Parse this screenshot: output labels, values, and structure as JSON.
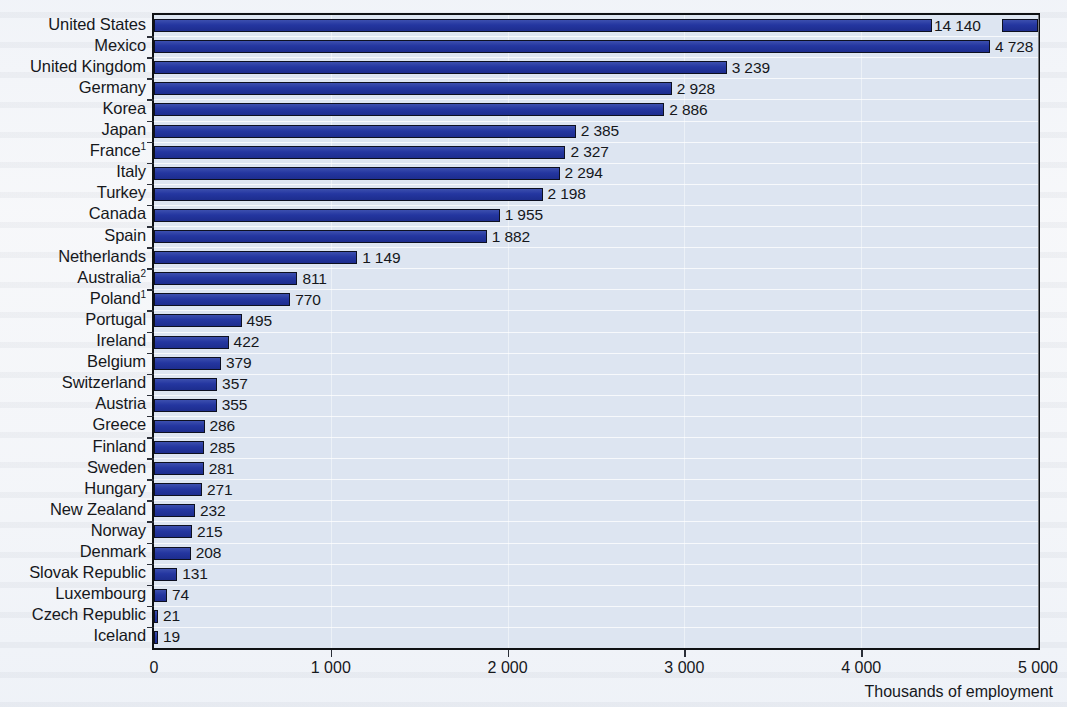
{
  "chart_data": {
    "type": "bar",
    "orientation": "horizontal",
    "title": "",
    "xlabel": "Thousands of employment",
    "ylabel": "",
    "xlim": [
      0,
      5000
    ],
    "xticks": [
      0,
      1000,
      2000,
      3000,
      4000,
      5000
    ],
    "xtick_labels": [
      "0",
      "1 000",
      "2 000",
      "3 000",
      "4 000",
      "5 000"
    ],
    "grid": true,
    "legend": "none",
    "bar_color": "#2436a0",
    "bar_edge_color": "#0d1020",
    "plot_background": "#dde5f1",
    "categories": [
      "United States",
      "Mexico",
      "United Kingdom",
      "Germany",
      "Korea",
      "Japan",
      "France",
      "Italy",
      "Turkey",
      "Canada",
      "Spain",
      "Netherlands",
      "Australia",
      "Poland",
      "Portugal",
      "Ireland",
      "Belgium",
      "Switzerland",
      "Austria",
      "Greece",
      "Finland",
      "Sweden",
      "Hungary",
      "New Zealand",
      "Norway",
      "Denmark",
      "Slovak Republic",
      "Luxembourg",
      "Czech Republic",
      "Iceland"
    ],
    "category_footnotes": [
      "",
      "",
      "",
      "",
      "",
      "",
      "1",
      "",
      "",
      "",
      "",
      "",
      "2",
      "1",
      "",
      "",
      "",
      "",
      "",
      "",
      "",
      "",
      "",
      "",
      "",
      "",
      "",
      "",
      "",
      ""
    ],
    "values": [
      14140,
      4728,
      3239,
      2928,
      2886,
      2385,
      2327,
      2294,
      2198,
      1955,
      1882,
      1149,
      811,
      770,
      495,
      422,
      379,
      357,
      355,
      286,
      285,
      281,
      271,
      232,
      215,
      208,
      131,
      74,
      21,
      19
    ],
    "value_labels": [
      "14 140",
      "4 728",
      "3 239",
      "2 928",
      "2 886",
      "2 385",
      "2 327",
      "2 294",
      "2 198",
      "1 955",
      "1 882",
      "1 149",
      "811",
      "770",
      "495",
      "422",
      "379",
      "357",
      "355",
      "286",
      "285",
      "281",
      "271",
      "232",
      "215",
      "208",
      "131",
      "74",
      "21",
      "19"
    ],
    "broken_bars": [
      {
        "category": "United States",
        "note": "bar is axis-broken; drawn to the right edge with a gap where the value label sits"
      }
    ],
    "footnotes": []
  }
}
